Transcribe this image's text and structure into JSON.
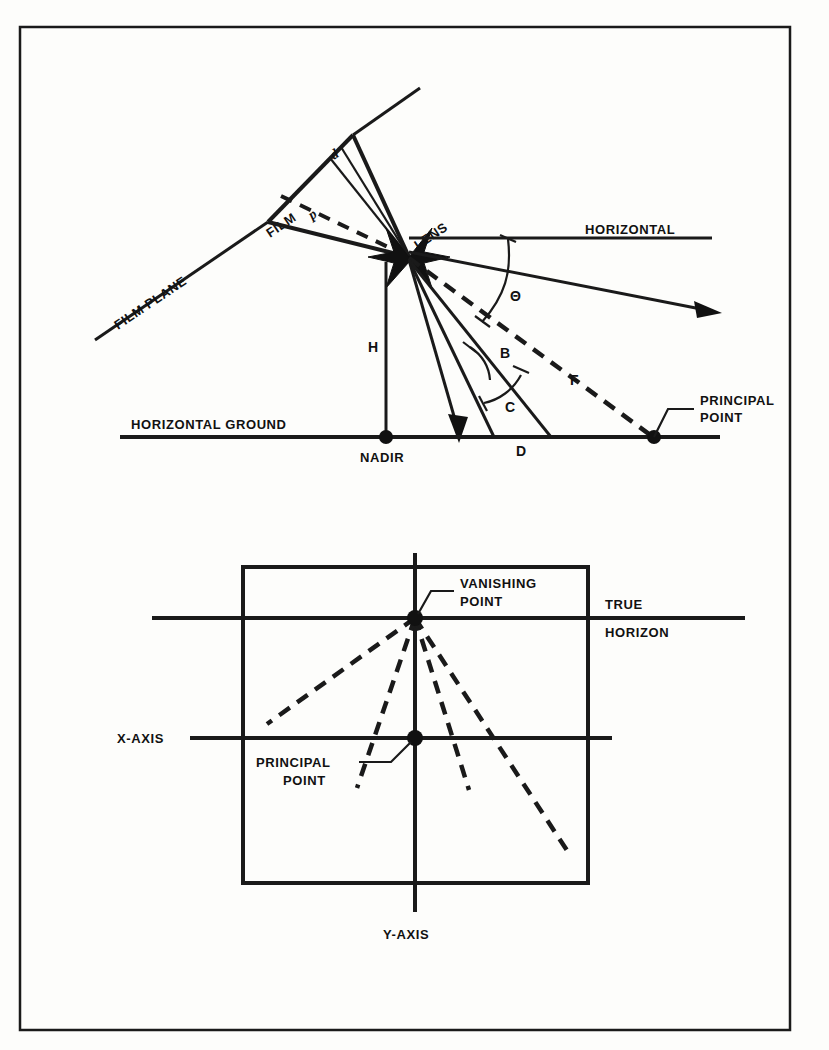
{
  "figure": {
    "frame_color": "#1a1a1a",
    "background_color": "#fdfdfb"
  },
  "upper_diagram": {
    "name": "side-view-tilted-camera-geometry",
    "labels": {
      "film_plane": "FILM PLANE",
      "film": "FILM",
      "lens": "LENS",
      "horizontal": "HORIZONTAL",
      "horizontal_ground": "HORIZONTAL GROUND",
      "nadir": "NADIR",
      "principal_point": "PRINCIPAL\nPOINT",
      "principal_point_line1": "PRINCIPAL",
      "principal_point_line2": "POINT",
      "height": "H",
      "focal_d": "d",
      "focal_p": "p",
      "angle_theta": "Θ",
      "angle_b": "B",
      "angle_c": "C",
      "angle_d": "D",
      "angle_f": "F"
    }
  },
  "lower_diagram": {
    "name": "photo-plane-vanishing-point",
    "labels": {
      "vanishing_point_line1": "VANISHING",
      "vanishing_point_line2": "POINT",
      "true_line1": "TRUE",
      "true_line2": "HORIZON",
      "x_axis": "X-AXIS",
      "y_axis": "Y-AXIS",
      "principal_point_line1": "PRINCIPAL",
      "principal_point_line2": "POINT"
    }
  }
}
